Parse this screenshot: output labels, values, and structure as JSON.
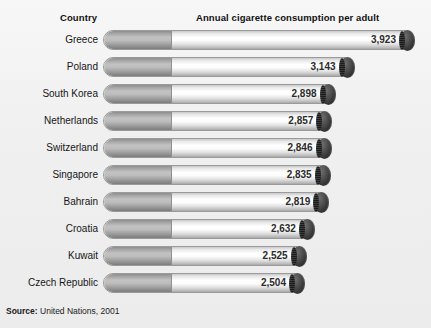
{
  "header": {
    "country_label": "Country",
    "metric_label": "Annual cigarette consumption per adult"
  },
  "source": {
    "prefix": "Source:",
    "text": "United Nations, 2001"
  },
  "colors": {
    "background": "#f2f2f2",
    "text": "#1a1a1a",
    "cigarette_paper": "#ffffff",
    "cigarette_filter": "#a8a8a8",
    "cigarette_tip": "#2e2e2e",
    "border": "#9a9a9a"
  },
  "chart_data": {
    "type": "bar",
    "title": "Annual cigarette consumption per adult",
    "xlabel": "Annual cigarette consumption per adult",
    "ylabel": "Country",
    "orientation": "horizontal",
    "grid": false,
    "legend": false,
    "value_labels_shown": true,
    "axis_origin_note": "Bars drawn as cigarettes on a truncated scale; lengths are not proportional to zero.",
    "categories": [
      "Greece",
      "Poland",
      "South Korea",
      "Netherlands",
      "Switzerland",
      "Singapore",
      "Bahrain",
      "Croatia",
      "Kuwait",
      "Czech Republic"
    ],
    "values": [
      3923,
      3143,
      2898,
      2857,
      2846,
      2835,
      2819,
      2632,
      2525,
      2504
    ],
    "value_labels": [
      "3,923",
      "3,143",
      "2,898",
      "2,857",
      "2,846",
      "2,835",
      "2,819",
      "2,632",
      "2,525",
      "2,504"
    ],
    "xlim": [
      1700,
      4050
    ],
    "units": "cigarettes per adult per year"
  }
}
